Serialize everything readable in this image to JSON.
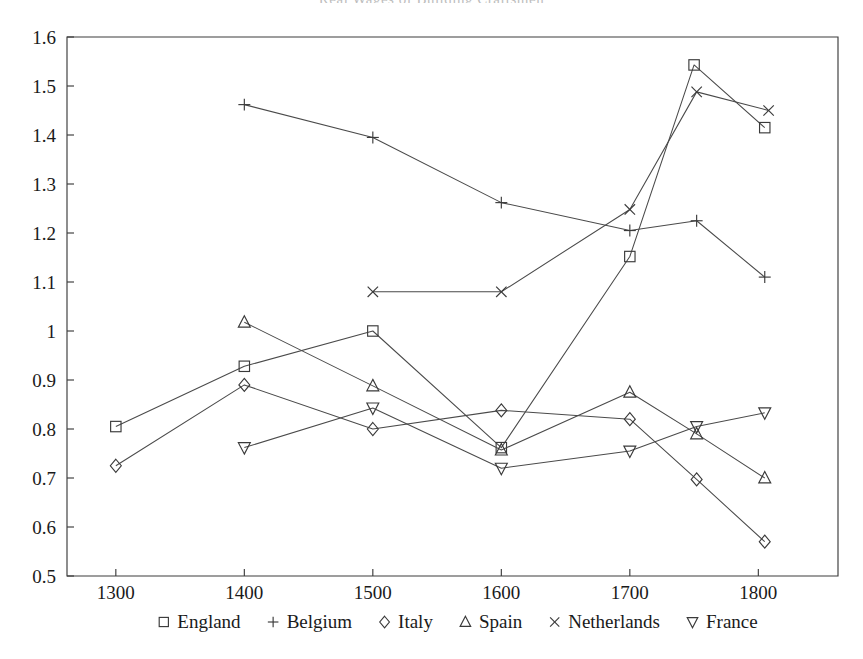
{
  "figure": {
    "clipped_title": "Real Wages of Building Craftsmen",
    "width": 863,
    "height": 659
  },
  "chart_data": {
    "type": "line",
    "title": "",
    "xlabel": "",
    "ylabel": "",
    "x": [
      1300,
      1400,
      1500,
      1600,
      1700,
      1750,
      1800
    ],
    "xlim": [
      1262,
      1862
    ],
    "ylim": [
      0.5,
      1.6
    ],
    "xticks": [
      1300,
      1400,
      1500,
      1600,
      1700,
      1800
    ],
    "xticklabels": [
      "1300",
      "1400",
      "1500",
      "1600",
      "1700",
      "1800"
    ],
    "yticks": [
      0.5,
      0.6,
      0.7,
      0.8,
      0.9,
      1.0,
      1.1,
      1.2,
      1.3,
      1.4,
      1.5,
      1.6
    ],
    "yticklabels": [
      "0.5",
      "0.6",
      "0.7",
      "0.8",
      "0.9",
      "1",
      "1.1",
      "1.2",
      "1.3",
      "1.4",
      "1.5",
      "1.6"
    ],
    "grid": false,
    "legend_position": "below-axes",
    "series": [
      {
        "name": "England",
        "marker": "square",
        "points": [
          {
            "x": 1300,
            "y": 0.805
          },
          {
            "x": 1400,
            "y": 0.928
          },
          {
            "x": 1500,
            "y": 1.0
          },
          {
            "x": 1600,
            "y": 0.762
          },
          {
            "x": 1700,
            "y": 1.152
          },
          {
            "x": 1750,
            "y": 1.543
          },
          {
            "x": 1805,
            "y": 1.415
          }
        ]
      },
      {
        "name": "Belgium",
        "marker": "plus",
        "points": [
          {
            "x": 1400,
            "y": 1.462
          },
          {
            "x": 1500,
            "y": 1.395
          },
          {
            "x": 1600,
            "y": 1.262
          },
          {
            "x": 1700,
            "y": 1.205
          },
          {
            "x": 1752,
            "y": 1.225
          },
          {
            "x": 1805,
            "y": 1.11
          }
        ]
      },
      {
        "name": "Italy",
        "marker": "diamond",
        "points": [
          {
            "x": 1300,
            "y": 0.725
          },
          {
            "x": 1400,
            "y": 0.89
          },
          {
            "x": 1500,
            "y": 0.8
          },
          {
            "x": 1600,
            "y": 0.838
          },
          {
            "x": 1700,
            "y": 0.82
          },
          {
            "x": 1752,
            "y": 0.697
          },
          {
            "x": 1805,
            "y": 0.57
          }
        ]
      },
      {
        "name": "Spain",
        "marker": "triangle-up",
        "points": [
          {
            "x": 1400,
            "y": 1.018
          },
          {
            "x": 1500,
            "y": 0.888
          },
          {
            "x": 1600,
            "y": 0.757
          },
          {
            "x": 1700,
            "y": 0.875
          },
          {
            "x": 1752,
            "y": 0.79
          },
          {
            "x": 1805,
            "y": 0.7
          }
        ]
      },
      {
        "name": "Netherlands",
        "marker": "cross",
        "points": [
          {
            "x": 1500,
            "y": 1.08
          },
          {
            "x": 1600,
            "y": 1.08
          },
          {
            "x": 1700,
            "y": 1.248
          },
          {
            "x": 1752,
            "y": 1.488
          },
          {
            "x": 1808,
            "y": 1.45
          }
        ]
      },
      {
        "name": "France",
        "marker": "triangle-down",
        "points": [
          {
            "x": 1400,
            "y": 0.762
          },
          {
            "x": 1500,
            "y": 0.843
          },
          {
            "x": 1600,
            "y": 0.72
          },
          {
            "x": 1700,
            "y": 0.755
          },
          {
            "x": 1752,
            "y": 0.805
          },
          {
            "x": 1805,
            "y": 0.833
          }
        ]
      }
    ]
  },
  "legend": {
    "entries": [
      {
        "label": "England",
        "marker": "square"
      },
      {
        "label": "Belgium",
        "marker": "plus"
      },
      {
        "label": "Italy",
        "marker": "diamond"
      },
      {
        "label": "Spain",
        "marker": "triangle-up"
      },
      {
        "label": "Netherlands",
        "marker": "cross"
      },
      {
        "label": "France",
        "marker": "triangle-down"
      }
    ]
  },
  "style": {
    "line_color": "#4a4a4a",
    "marker_color": "#3a3a3a",
    "axis_color": "#3c3c3c",
    "text_color": "#1a1a1a",
    "background": "#ffffff"
  }
}
